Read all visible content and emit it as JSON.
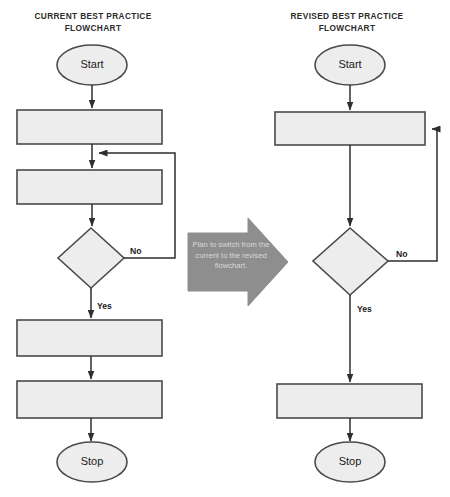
{
  "diagram": {
    "type": "flowchart-comparison",
    "background_color": "#ffffff",
    "shape_fill_color": "#ededed",
    "shape_stroke_color": "#4a4a4a",
    "connector_color": "#2e2e2e",
    "callout_color": "#8e8e8e",
    "callout_text_color": "#d8d8d8"
  },
  "left_chart": {
    "title": "CURRENT BEST PRACTICE\nFLOWCHART",
    "nodes": [
      {
        "id": "start",
        "shape": "terminator",
        "label": "Start"
      },
      {
        "id": "process1",
        "shape": "process",
        "label": ""
      },
      {
        "id": "process2",
        "shape": "process",
        "label": ""
      },
      {
        "id": "decision",
        "shape": "decision",
        "label": ""
      },
      {
        "id": "process3",
        "shape": "process",
        "label": ""
      },
      {
        "id": "process4",
        "shape": "process",
        "label": ""
      },
      {
        "id": "stop",
        "shape": "terminator",
        "label": "Stop"
      }
    ],
    "branch_labels": {
      "no": "No",
      "yes": "Yes"
    },
    "edges": [
      {
        "from": "start",
        "to": "process1",
        "label": ""
      },
      {
        "from": "process1",
        "to": "process2",
        "label": ""
      },
      {
        "from": "process2",
        "to": "decision",
        "label": ""
      },
      {
        "from": "decision",
        "to": "process2",
        "label": "No"
      },
      {
        "from": "decision",
        "to": "process3",
        "label": "Yes"
      },
      {
        "from": "process3",
        "to": "process4",
        "label": ""
      },
      {
        "from": "process4",
        "to": "stop",
        "label": ""
      }
    ]
  },
  "right_chart": {
    "title": "REVISED BEST PRACTICE\nFLOWCHART",
    "nodes": [
      {
        "id": "start",
        "shape": "terminator",
        "label": "Start"
      },
      {
        "id": "process1",
        "shape": "process",
        "label": ""
      },
      {
        "id": "decision",
        "shape": "decision",
        "label": ""
      },
      {
        "id": "process2",
        "shape": "process",
        "label": ""
      },
      {
        "id": "stop",
        "shape": "terminator",
        "label": "Stop"
      }
    ],
    "branch_labels": {
      "no": "No",
      "yes": "Yes"
    },
    "edges": [
      {
        "from": "start",
        "to": "process1",
        "label": ""
      },
      {
        "from": "process1",
        "to": "decision",
        "label": ""
      },
      {
        "from": "decision",
        "to": "process1",
        "label": "No"
      },
      {
        "from": "decision",
        "to": "process2",
        "label": "Yes"
      },
      {
        "from": "process2",
        "to": "stop",
        "label": ""
      }
    ]
  },
  "callout": {
    "shape": "right-arrow",
    "text": "Plan to switch from the current to the revised flowchart."
  }
}
